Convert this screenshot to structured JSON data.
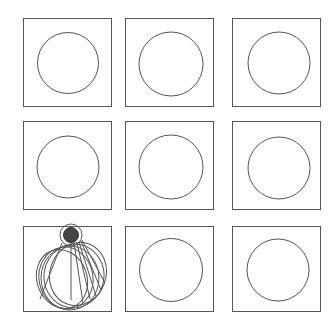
{
  "figure": {
    "stroke_color": "#555555",
    "shade_color": "#444444",
    "grid": {
      "rows": 3,
      "cols": 3,
      "cells": [
        {
          "row": 0,
          "col": 0,
          "type": "circle"
        },
        {
          "row": 0,
          "col": 1,
          "type": "circle"
        },
        {
          "row": 0,
          "col": 2,
          "type": "circle"
        },
        {
          "row": 1,
          "col": 0,
          "type": "circle"
        },
        {
          "row": 1,
          "col": 1,
          "type": "circle"
        },
        {
          "row": 1,
          "col": 2,
          "type": "circle"
        },
        {
          "row": 2,
          "col": 0,
          "type": "cone-sweep"
        },
        {
          "row": 2,
          "col": 1,
          "type": "circle"
        },
        {
          "row": 2,
          "col": 2,
          "type": "circle"
        }
      ]
    }
  }
}
